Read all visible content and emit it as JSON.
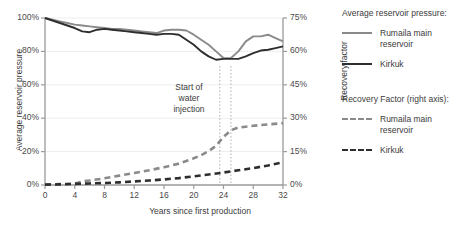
{
  "chart_data": {
    "type": "line",
    "title": "",
    "xlabel": "Years since first production",
    "ylabel": "Average reservoir pressure",
    "ylabel_right": "Recovery factor",
    "xlim": [
      0,
      32
    ],
    "ylim": [
      0,
      100
    ],
    "ylim_right": [
      0,
      75
    ],
    "grid": true,
    "legend_position": "right",
    "xticks": [
      "0",
      "4",
      "8",
      "12",
      "16",
      "20",
      "24",
      "28",
      "32"
    ],
    "xtick_values": [
      0,
      4,
      8,
      12,
      16,
      20,
      24,
      28,
      32
    ],
    "yticks_left": [
      "0%",
      "20%",
      "40%",
      "60%",
      "80%",
      "100%"
    ],
    "ytick_values_left": [
      0,
      20,
      40,
      60,
      80,
      100
    ],
    "yticks_right": [
      "0%",
      "15%",
      "30%",
      "45%",
      "60%",
      "75%"
    ],
    "ytick_values_right": [
      0,
      15,
      30,
      45,
      60,
      75
    ],
    "annotations": [
      {
        "text_lines": [
          "Start of",
          "water",
          "injection"
        ],
        "text": "Start of water injection",
        "x_marks": [
          23.5,
          25.0
        ]
      }
    ],
    "series": [
      {
        "name": "Rumaila main reservoir",
        "group": "Average reservoir pressure:",
        "axis": "left",
        "style": "solid",
        "color": "#8a8a8a",
        "x": [
          0,
          1,
          2,
          3,
          4,
          5,
          6,
          7,
          8,
          9,
          10,
          11,
          12,
          13,
          14,
          15,
          16,
          17,
          18,
          19,
          20,
          21,
          22,
          23,
          24,
          25,
          26,
          27,
          28,
          29,
          30,
          31,
          32
        ],
        "y": [
          100,
          99,
          98,
          97,
          96,
          95.5,
          95,
          94.5,
          94,
          93.5,
          93.5,
          93,
          92.5,
          92,
          91.5,
          91,
          92.5,
          93,
          93,
          92.5,
          90,
          87,
          84,
          80,
          76,
          76,
          80,
          86,
          89,
          89,
          90,
          88,
          86
        ]
      },
      {
        "name": "Kirkuk",
        "group": "Average reservoir pressure:",
        "axis": "left",
        "style": "solid",
        "color": "#2e2e2e",
        "x": [
          0,
          1,
          2,
          3,
          4,
          5,
          6,
          7,
          8,
          9,
          10,
          11,
          12,
          13,
          14,
          15,
          16,
          17,
          18,
          19,
          20,
          21,
          22,
          23,
          24,
          25,
          26,
          27,
          28,
          29,
          30,
          31,
          32
        ],
        "y": [
          100,
          98.5,
          97,
          95.5,
          94,
          92,
          91.5,
          93,
          93.5,
          93,
          92.5,
          92,
          91.5,
          91,
          90.5,
          90,
          90.5,
          90.5,
          90,
          87,
          84,
          80,
          77,
          75,
          75.5,
          75.5,
          75.5,
          77,
          79,
          80.5,
          81,
          82,
          83
        ]
      },
      {
        "name": "Rumaila main reservoir",
        "group": "Recovery Factor (right axis):",
        "axis": "right",
        "style": "dashed",
        "color": "#8a8a8a",
        "x": [
          0,
          2,
          4,
          5,
          6,
          8,
          10,
          12,
          14,
          16,
          18,
          20,
          21,
          22,
          23,
          24,
          25,
          26,
          28,
          30,
          32
        ],
        "y": [
          0.2,
          0.4,
          0.6,
          1.6,
          2.0,
          3.0,
          4.2,
          5.4,
          6.6,
          8.0,
          9.6,
          12.0,
          13.4,
          15.2,
          17.6,
          21.6,
          24.6,
          25.8,
          26.6,
          27.2,
          27.8
        ]
      },
      {
        "name": "Kirkuk",
        "group": "Recovery Factor (right axis):",
        "axis": "right",
        "style": "dashed",
        "color": "#2e2e2e",
        "x": [
          0,
          2,
          4,
          6,
          8,
          10,
          12,
          14,
          16,
          18,
          20,
          22,
          24,
          26,
          28,
          30,
          32
        ],
        "y": [
          0.15,
          0.3,
          0.5,
          0.7,
          0.9,
          1.2,
          1.6,
          2.0,
          2.5,
          3.1,
          3.9,
          4.7,
          5.6,
          6.6,
          7.6,
          8.8,
          10.2
        ]
      }
    ]
  },
  "legend": {
    "heading_pressure": "Average reservoir pressure:",
    "heading_recovery": "Recovery Factor (right axis):",
    "items_pressure": [
      {
        "label": "Rumaila main reservoir"
      },
      {
        "label": "Kirkuk"
      }
    ],
    "items_recovery": [
      {
        "label": "Rumaila main reservoir"
      },
      {
        "label": "Kirkuk"
      }
    ]
  },
  "colors": {
    "rumaila": "#8a8a8a",
    "kirkuk": "#2e2e2e",
    "axis": "#9a9a9a",
    "grid": "#ededed",
    "text": "#3b3b3b",
    "background": "#ffffff"
  }
}
